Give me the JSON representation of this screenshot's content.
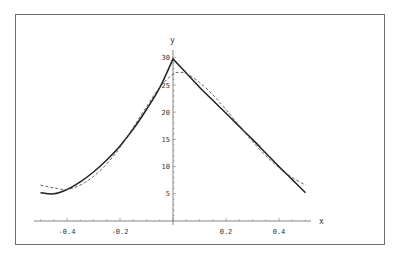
{
  "chart_data": {
    "type": "line",
    "title": "",
    "xlabel": "x",
    "ylabel": "y",
    "xlim": [
      -0.5,
      0.5
    ],
    "ylim": [
      0,
      30
    ],
    "grid": false,
    "legend": null,
    "x_ticks": [
      "-0.4",
      "-0.2",
      "0.2",
      "0.4"
    ],
    "y_ticks": [
      "5",
      "10",
      "15",
      "20",
      "25",
      "30"
    ],
    "series": [
      {
        "name": "exact",
        "style": "solid",
        "x": [
          -0.5,
          -0.45,
          -0.4,
          -0.35,
          -0.3,
          -0.25,
          -0.2,
          -0.15,
          -0.1,
          -0.05,
          0,
          0.05,
          0.1,
          0.15,
          0.2,
          0.25,
          0.3,
          0.35,
          0.4,
          0.45,
          0.5
        ],
        "y": [
          5.2,
          5.0,
          5.8,
          7.2,
          9.0,
          11.2,
          13.8,
          16.9,
          20.5,
          24.5,
          29.8,
          27.2,
          24.6,
          22.2,
          19.8,
          17.4,
          15.0,
          12.5,
          10.0,
          7.6,
          5.2
        ]
      },
      {
        "name": "approximation",
        "style": "dashed",
        "x": [
          -0.5,
          -0.45,
          -0.4,
          -0.35,
          -0.3,
          -0.25,
          -0.2,
          -0.15,
          -0.1,
          -0.05,
          0,
          0.025,
          0.05,
          0.1,
          0.15,
          0.2,
          0.25,
          0.3,
          0.35,
          0.4,
          0.45,
          0.5
        ],
        "y": [
          6.6,
          6.1,
          5.8,
          6.6,
          8.2,
          10.5,
          13.5,
          17.2,
          21.0,
          24.6,
          27.0,
          27.3,
          27.1,
          25.5,
          23.2,
          20.5,
          17.5,
          14.6,
          12.0,
          9.8,
          8.0,
          6.6
        ]
      }
    ]
  }
}
